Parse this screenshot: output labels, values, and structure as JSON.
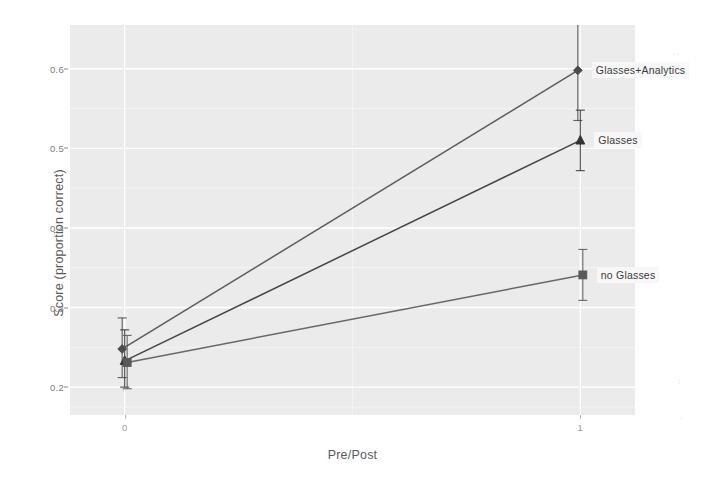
{
  "chart_data": {
    "type": "line",
    "title": "",
    "xlabel": "Pre/Post",
    "ylabel": "Score (proportion correct)",
    "x": [
      0,
      1
    ],
    "x_tick_labels": [
      "0",
      "1"
    ],
    "xlim": [
      -0.12,
      1.12
    ],
    "ylim": [
      0.165,
      0.655
    ],
    "y_ticks": [
      0.2,
      0.3,
      0.4,
      0.5,
      0.6
    ],
    "y_tick_labels": [
      "0.2",
      "0.3",
      "0.4",
      "0.5",
      "0.6"
    ],
    "grid": true,
    "grid_minor": true,
    "legend": "none (direct point labels at right)",
    "error_bars": "standard error, vertical with caps",
    "series": [
      {
        "name": "Glasses+Analytics",
        "marker": "diamond",
        "color": "#4d4d4d",
        "values": [
          0.248,
          0.598
        ],
        "err_low": [
          0.212,
          0.535
        ],
        "err_high": [
          0.287,
          0.662
        ],
        "label": "Glasses+Analytics"
      },
      {
        "name": "Glasses",
        "marker": "triangle",
        "color": "#333333",
        "values": [
          0.233,
          0.51
        ],
        "err_low": [
          0.2,
          0.472
        ],
        "err_high": [
          0.272,
          0.548
        ],
        "label": "Glasses"
      },
      {
        "name": "no Glasses",
        "marker": "square",
        "color": "#595959",
        "values": [
          0.231,
          0.341
        ],
        "err_low": [
          0.198,
          0.309
        ],
        "err_high": [
          0.265,
          0.373
        ],
        "label": "no Glasses"
      }
    ]
  },
  "axes": {
    "y_title": "Score (proportion correct)",
    "x_title": "Pre/Post",
    "y_tick_labels": [
      "0.6",
      "0.5",
      "0.4",
      "0.3",
      "0.2"
    ],
    "x_tick_labels": [
      "0",
      "1"
    ]
  },
  "labels": {
    "glasses_analytics": "Glasses+Analytics",
    "glasses": "Glasses",
    "no_glasses": "no Glasses"
  },
  "colors": {
    "panel_background": "#ebebeb",
    "grid_major": "#ffffff",
    "grid_minor": "#f5f5f5",
    "series_glasses_analytics": "#4d4d4d",
    "series_glasses": "#333333",
    "series_no_glasses": "#595959",
    "axis_text": "#7d7d7d",
    "axis_title": "#5a5a5a"
  }
}
